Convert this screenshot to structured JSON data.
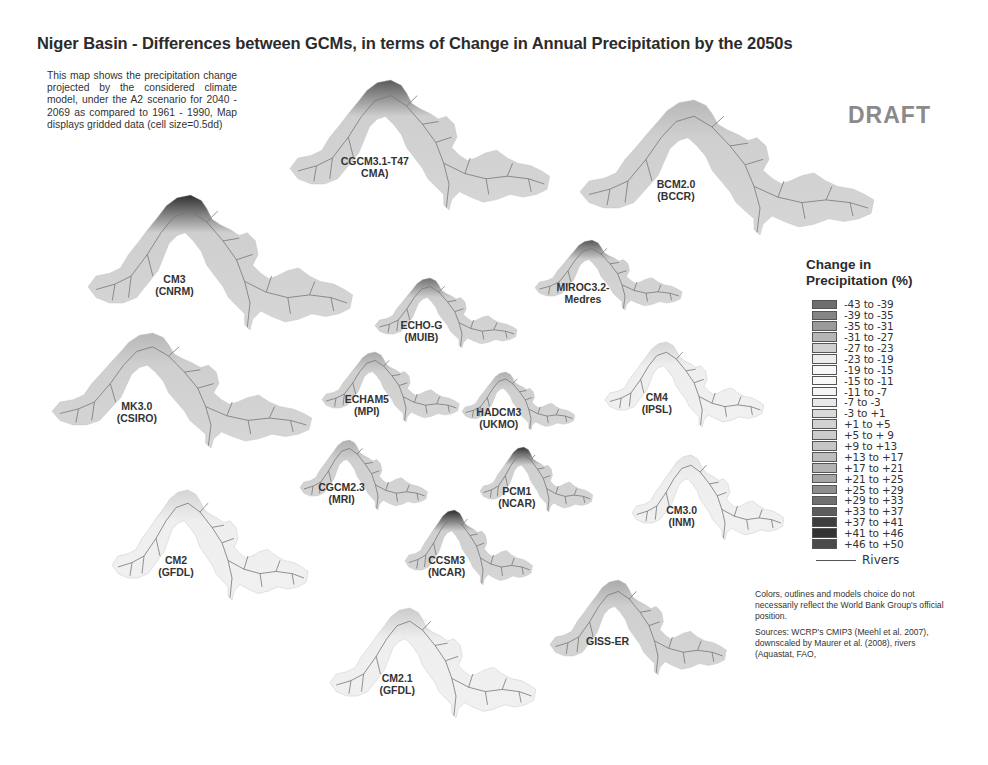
{
  "title": "Niger Basin - Differences between GCMs, in terms of Change in Annual Precipitation by the 2050s",
  "description": "This map shows the precipitation change projected by the considered climate model, under the A2 scenario for 2040 - 2069 as compared to 1961 - 1990, Map displays gridded data (cell size=0.5dd)",
  "watermark": "DRAFT",
  "maps": [
    {
      "id": "cgcm31",
      "label_line1": "CGCM3.1-T47",
      "label_line2": "CMA)",
      "x": 290,
      "y": 80,
      "w": 265,
      "h": 130,
      "hot_color": "#5a5a5a",
      "style": "filled"
    },
    {
      "id": "bcm20",
      "label_line1": "BCM2.0",
      "label_line2": "(BCCR)",
      "x": 580,
      "y": 100,
      "w": 300,
      "h": 135,
      "hot_color": "#b8b8b8",
      "style": "filled"
    },
    {
      "id": "cm3_cnrm",
      "label_line1": "CM3",
      "label_line2": "(CNRM)",
      "x": 88,
      "y": 195,
      "w": 270,
      "h": 135,
      "hot_color": "#2f2f2f",
      "style": "filled"
    },
    {
      "id": "echog",
      "label_line1": "ECHO-G",
      "label_line2": "(MUIB)",
      "x": 375,
      "y": 278,
      "w": 145,
      "h": 70,
      "hot_color": "#707070",
      "style": "filled"
    },
    {
      "id": "miroc32",
      "label_line1": "MIROC3.2-",
      "label_line2": "Medres",
      "x": 535,
      "y": 240,
      "w": 150,
      "h": 70,
      "hot_color": "#555555",
      "style": "filled"
    },
    {
      "id": "mk30",
      "label_line1": "MK3.0",
      "label_line2": "(CSIRO)",
      "x": 52,
      "y": 333,
      "w": 265,
      "h": 115,
      "hot_color": "#b8b8b8",
      "style": "filled"
    },
    {
      "id": "echam5",
      "label_line1": "ECHAM5",
      "label_line2": "(MPI)",
      "x": 322,
      "y": 352,
      "w": 140,
      "h": 70,
      "hot_color": "#a8a8a8",
      "style": "filled"
    },
    {
      "id": "hadcm3",
      "label_line1": "HADCM3",
      "label_line2": "(UKMO)",
      "x": 462,
      "y": 372,
      "w": 115,
      "h": 58,
      "hot_color": "#b0b0b0",
      "style": "filled"
    },
    {
      "id": "cm4_ipsl",
      "label_line1": "CM4",
      "label_line2": "(IPSL)",
      "x": 605,
      "y": 342,
      "w": 162,
      "h": 85,
      "hot_color": "#8a8a8a",
      "style": "sparse"
    },
    {
      "id": "cgcm23",
      "label_line1": "CGCM2.3",
      "label_line2": "(MRI)",
      "x": 300,
      "y": 440,
      "w": 130,
      "h": 70,
      "hot_color": "#b0b0b0",
      "style": "filled"
    },
    {
      "id": "pcm1",
      "label_line1": "PCM1",
      "label_line2": "(NCAR)",
      "x": 480,
      "y": 447,
      "w": 115,
      "h": 65,
      "hot_color": "#333333",
      "style": "filled"
    },
    {
      "id": "cm3_inm",
      "label_line1": "CM3.0",
      "label_line2": "(INM)",
      "x": 632,
      "y": 455,
      "w": 155,
      "h": 85,
      "hot_color": "#b5b5b5",
      "style": "sparse"
    },
    {
      "id": "cm2_gfdl",
      "label_line1": "CM2",
      "label_line2": "(GFDL)",
      "x": 112,
      "y": 490,
      "w": 200,
      "h": 110,
      "hot_color": "#858585",
      "style": "sparse"
    },
    {
      "id": "ccsm3",
      "label_line1": "CCSM3",
      "label_line2": "(NCAR)",
      "x": 405,
      "y": 510,
      "w": 130,
      "h": 75,
      "hot_color": "#2a2a2a",
      "style": "filled"
    },
    {
      "id": "giss_er",
      "label_line1": "GISS-ER",
      "label_line2": "",
      "x": 550,
      "y": 580,
      "w": 180,
      "h": 95,
      "hot_color": "#aaaaaa",
      "style": "filled"
    },
    {
      "id": "cm21_gfdl",
      "label_line1": "CM2.1",
      "label_line2": "(GFDL)",
      "x": 330,
      "y": 608,
      "w": 210,
      "h": 110,
      "hot_color": "#6a6a6a",
      "style": "sparse"
    }
  ],
  "legend": {
    "title_line1": "Change in",
    "title_line2": "Precipitation (%)",
    "items": [
      {
        "label": "-43 to -39",
        "color": "#6e6e6e"
      },
      {
        "label": "-39 to -35",
        "color": "#858585"
      },
      {
        "label": "-35 to -31",
        "color": "#9a9a9a"
      },
      {
        "label": "-31 to -27",
        "color": "#b5b5b5"
      },
      {
        "label": "-27 to -23",
        "color": "#d0d0d0"
      },
      {
        "label": "-23 to -19",
        "color": "#ececec"
      },
      {
        "label": "-19 to -15",
        "color": "#f8f8f8"
      },
      {
        "label": "-15 to -11",
        "color": "#f8f8f8"
      },
      {
        "label": "-11 to -7",
        "color": "#f4f4f4"
      },
      {
        "label": "-7 to -3",
        "color": "#e8e8e8"
      },
      {
        "label": "-3 to +1",
        "color": "#dadada"
      },
      {
        "label": "+1 to +5",
        "color": "#d2d2d2"
      },
      {
        "label": "+5 to + 9",
        "color": "#cccccc"
      },
      {
        "label": "+9 to +13",
        "color": "#c6c6c6"
      },
      {
        "label": "+13 to +17",
        "color": "#bdbdbd"
      },
      {
        "label": "+17 to +21",
        "color": "#b3b3b3"
      },
      {
        "label": "+21 to +25",
        "color": "#a6a6a6"
      },
      {
        "label": "+25 to +29",
        "color": "#8e8e8e"
      },
      {
        "label": "+29 to +33",
        "color": "#707070"
      },
      {
        "label": "+33 to +37",
        "color": "#5c5c5c"
      },
      {
        "label": "+37 to +41",
        "color": "#3e3e3e"
      },
      {
        "label": "+41 to +46",
        "color": "#333333"
      },
      {
        "label": "+46 to +50",
        "color": "#4a4a4a"
      }
    ],
    "rivers_label": "Rivers"
  },
  "disclaimer": "Colors, outlines and models choice do not necessarily reflect the World Bank Group's official position.",
  "sources": "Sources: WCRP's CMIP3 (Meehl et al. 2007), downscaled by Maurer et al. (2008), rivers (Aquastat, FAO,"
}
